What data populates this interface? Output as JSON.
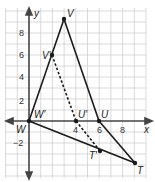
{
  "diagram": {
    "type": "coordinate-plane-dilation",
    "axes": {
      "x_label": "x",
      "y_label": "y"
    },
    "x_ticks": [
      {
        "value": 4,
        "label": "4"
      },
      {
        "value": 6,
        "label": "6"
      },
      {
        "value": 8,
        "label": "8"
      }
    ],
    "y_ticks": [
      {
        "value": 8,
        "label": "8"
      },
      {
        "value": 6,
        "label": "6"
      },
      {
        "value": 4,
        "label": "4"
      },
      {
        "value": 2,
        "label": "2"
      },
      {
        "value": -2,
        "label": "−2"
      }
    ],
    "original_triangle": {
      "style": "solid",
      "vertices": [
        {
          "name": "V",
          "x": 3,
          "y": 9
        },
        {
          "name": "U",
          "x": 6,
          "y": 0
        },
        {
          "name": "T",
          "x": 9,
          "y": -4
        },
        {
          "name": "W",
          "x": 0,
          "y": 0
        }
      ]
    },
    "image_triangle": {
      "style": "dashed",
      "vertices": [
        {
          "name": "V'",
          "x": 2,
          "y": 6
        },
        {
          "name": "U'",
          "x": 4,
          "y": 0
        },
        {
          "name": "T'",
          "x": 6,
          "y": -2.7
        },
        {
          "name": "W'",
          "x": 0,
          "y": 0
        }
      ]
    },
    "labels": {
      "V": "V",
      "V_prime": "V′",
      "U": "U",
      "U_prime": "U′",
      "T": "T",
      "T_prime": "T′",
      "W": "W",
      "W_prime": "W′"
    },
    "colors": {
      "grid": "#c8c8c8",
      "axis": "#333333",
      "lines": "#1a1a1a"
    }
  }
}
